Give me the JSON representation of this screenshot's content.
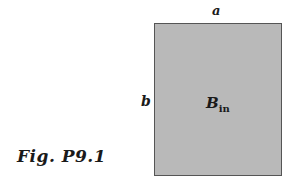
{
  "figure": {
    "caption": "Fig. P9.1",
    "labels": {
      "width": "a",
      "height": "b",
      "field_symbol": "B",
      "field_subscript": "in"
    },
    "colors": {
      "rectangle_fill": "#b9b9b9",
      "rectangle_border": "#555555",
      "text": "#1a1a1a"
    }
  }
}
